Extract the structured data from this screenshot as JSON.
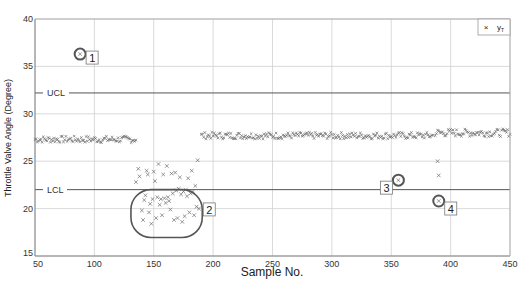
{
  "chart_data": {
    "type": "scatter",
    "title": "",
    "xlabel": "Sample No.",
    "ylabel": "Throttle Valve Angle (Degree)",
    "xlim": [
      50,
      450
    ],
    "ylim": [
      15,
      40
    ],
    "xticks": [
      50,
      100,
      150,
      200,
      250,
      300,
      350,
      400,
      450
    ],
    "yticks": [
      15,
      20,
      25,
      30,
      35,
      40
    ],
    "grid": true,
    "legend": {
      "position": "upper right",
      "entries": [
        {
          "marker": "x",
          "label": "yT"
        }
      ]
    },
    "control_limits": [
      {
        "name": "UCL",
        "value": 32.2
      },
      {
        "name": "LCL",
        "value": 22.0
      }
    ],
    "segments": [
      {
        "name": "normal-1",
        "x_range": [
          50,
          135
        ],
        "mean": 27.3,
        "spread": 0.35
      },
      {
        "name": "normal-2",
        "x_range": [
          190,
          385
        ],
        "mean": 27.7,
        "spread": 0.35
      },
      {
        "name": "normal-3",
        "x_range": [
          387,
          450
        ],
        "mean": 28.0,
        "spread": 0.4
      }
    ],
    "series": [
      {
        "name": "yT",
        "marker": "x",
        "points": [
          [
            88,
            36.3
          ],
          [
            135,
            22.8
          ],
          [
            137,
            24.2
          ],
          [
            138,
            23.4
          ],
          [
            140,
            19.8
          ],
          [
            141,
            18.8
          ],
          [
            142,
            20.9
          ],
          [
            143,
            21.4
          ],
          [
            144,
            24.0
          ],
          [
            145,
            23.6
          ],
          [
            146,
            19.6
          ],
          [
            147,
            20.5
          ],
          [
            148,
            18.4
          ],
          [
            149,
            21.0
          ],
          [
            150,
            23.9
          ],
          [
            151,
            22.9
          ],
          [
            152,
            19.0
          ],
          [
            153,
            21.2
          ],
          [
            154,
            24.7
          ],
          [
            155,
            20.4
          ],
          [
            156,
            21.0
          ],
          [
            157,
            19.3
          ],
          [
            158,
            23.6
          ],
          [
            159,
            21.1
          ],
          [
            160,
            20.6
          ],
          [
            161,
            24.5
          ],
          [
            162,
            21.2
          ],
          [
            163,
            20.8
          ],
          [
            164,
            19.9
          ],
          [
            165,
            23.7
          ],
          [
            166,
            21.6
          ],
          [
            167,
            18.8
          ],
          [
            168,
            23.8
          ],
          [
            169,
            21.9
          ],
          [
            170,
            19.0
          ],
          [
            171,
            22.1
          ],
          [
            172,
            23.3
          ],
          [
            173,
            21.5
          ],
          [
            174,
            18.6
          ],
          [
            175,
            21.8
          ],
          [
            176,
            19.2
          ],
          [
            177,
            22.0
          ],
          [
            178,
            21.3
          ],
          [
            179,
            23.2
          ],
          [
            180,
            19.6
          ],
          [
            181,
            21.6
          ],
          [
            182,
            24.0
          ],
          [
            183,
            21.8
          ],
          [
            184,
            19.3
          ],
          [
            185,
            22.4
          ],
          [
            186,
            20.2
          ],
          [
            187,
            25.1
          ],
          [
            188,
            20.0
          ],
          [
            356,
            23.0
          ],
          [
            389,
            25.0
          ],
          [
            390,
            23.5
          ],
          [
            390,
            20.8
          ]
        ]
      }
    ],
    "annotations": [
      {
        "label": "1",
        "x": 88,
        "y": 36.3,
        "type": "circle"
      },
      {
        "label": "2",
        "x_range": [
          135,
          190
        ],
        "y_range": [
          17.8,
          22.0
        ],
        "type": "rounded-rect"
      },
      {
        "label": "3",
        "x": 356,
        "y": 23.0,
        "type": "circle"
      },
      {
        "label": "4",
        "x": 390,
        "y": 20.8,
        "type": "circle"
      }
    ]
  },
  "axes": {
    "xlabel": "Sample No.",
    "ylabel": "Throttle Valve Angle (Degree)",
    "xtick_labels": [
      "50",
      "100",
      "150",
      "200",
      "250",
      "300",
      "350",
      "400",
      "450"
    ],
    "ytick_labels": [
      "15",
      "20",
      "25",
      "30",
      "35",
      "40"
    ]
  },
  "limits": {
    "ucl_label": "UCL",
    "lcl_label": "LCL"
  },
  "legend": {
    "marker": "×",
    "label": "y",
    "subscript": "T"
  },
  "annotations": {
    "a1": "1",
    "a2": "2",
    "a3": "3",
    "a4": "4"
  },
  "colors": {
    "marker": "#6a6a6a",
    "grid": "#d0d0d0",
    "axis": "#808080",
    "limit_line": "#555555",
    "annotation": "#555555"
  }
}
